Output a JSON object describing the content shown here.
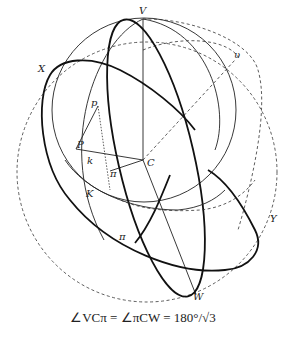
{
  "diagram": {
    "labels": {
      "V": "V",
      "v": "υ",
      "X": "X",
      "p": "p",
      "P": "P",
      "k": "k",
      "C": "C",
      "pi_upper": "π",
      "K": "K",
      "pi_lower": "π",
      "Y": "Y",
      "W": "W"
    },
    "formula": "∠VCπ = ∠πCW = 180°/√3"
  }
}
